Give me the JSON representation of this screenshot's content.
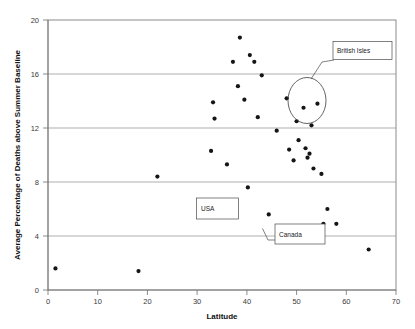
{
  "chart_data": {
    "type": "scatter",
    "title": "",
    "xlabel": "Latitude",
    "ylabel": "Average Percentage of Deaths above Summer Baseline",
    "xlim": [
      0,
      70
    ],
    "ylim": [
      0,
      20
    ],
    "xticks": [
      0,
      10,
      20,
      30,
      40,
      50,
      60,
      70
    ],
    "yticks": [
      0,
      4,
      8,
      12,
      16,
      20
    ],
    "grid": "horizontal",
    "legend": "none",
    "series": [
      {
        "name": "Regions",
        "points": [
          {
            "x": 1.5,
            "y": 1.6
          },
          {
            "x": 18.2,
            "y": 1.4
          },
          {
            "x": 22.0,
            "y": 8.4
          },
          {
            "x": 32.8,
            "y": 10.3
          },
          {
            "x": 33.2,
            "y": 13.9
          },
          {
            "x": 33.5,
            "y": 12.7
          },
          {
            "x": 36.0,
            "y": 9.3
          },
          {
            "x": 37.2,
            "y": 16.9
          },
          {
            "x": 38.2,
            "y": 15.1
          },
          {
            "x": 38.6,
            "y": 18.7
          },
          {
            "x": 39.5,
            "y": 14.1
          },
          {
            "x": 40.2,
            "y": 7.6
          },
          {
            "x": 40.6,
            "y": 17.4
          },
          {
            "x": 41.5,
            "y": 16.9
          },
          {
            "x": 42.2,
            "y": 12.8
          },
          {
            "x": 43.0,
            "y": 15.9
          },
          {
            "x": 44.4,
            "y": 5.6
          },
          {
            "x": 46.0,
            "y": 11.8
          },
          {
            "x": 46.5,
            "y": 3.9
          },
          {
            "x": 48.0,
            "y": 14.2
          },
          {
            "x": 48.5,
            "y": 10.4
          },
          {
            "x": 49.4,
            "y": 9.6
          },
          {
            "x": 50.0,
            "y": 12.5
          },
          {
            "x": 50.4,
            "y": 11.1
          },
          {
            "x": 51.0,
            "y": 3.6
          },
          {
            "x": 51.4,
            "y": 13.5
          },
          {
            "x": 51.8,
            "y": 10.5
          },
          {
            "x": 52.2,
            "y": 9.8
          },
          {
            "x": 52.6,
            "y": 10.1
          },
          {
            "x": 53.0,
            "y": 12.2
          },
          {
            "x": 53.4,
            "y": 9.0
          },
          {
            "x": 54.2,
            "y": 13.8
          },
          {
            "x": 55.0,
            "y": 8.6
          },
          {
            "x": 56.2,
            "y": 6.0
          },
          {
            "x": 55.4,
            "y": 4.9
          },
          {
            "x": 58.0,
            "y": 4.9
          },
          {
            "x": 64.5,
            "y": 3.0
          }
        ]
      }
    ],
    "annotations": [
      {
        "label": "British Isles",
        "kind": "ellipse-callout"
      },
      {
        "label": "USA",
        "kind": "box-callout"
      },
      {
        "label": "Canada",
        "kind": "box-callout"
      }
    ]
  },
  "axes": {
    "y_title": "Average Percentage of Deaths above Summer Baseline",
    "x_title": "Latitude",
    "y_tick_labels": [
      "0",
      "4",
      "8",
      "12",
      "16",
      "20"
    ],
    "x_tick_labels": [
      "0",
      "10",
      "20",
      "30",
      "40",
      "50",
      "60",
      "70"
    ]
  },
  "callouts": {
    "british_isles": "British Isles",
    "usa": "USA",
    "canada": "Canada"
  },
  "colors": {
    "point": "#151515",
    "grid": "#8c8c8c",
    "frame": "#6e6e6e",
    "text": "#111111",
    "background": "#ffffff"
  }
}
